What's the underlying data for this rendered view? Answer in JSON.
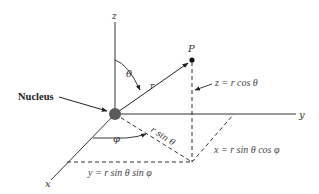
{
  "figure": {
    "labels": {
      "nucleus": "Nucleus",
      "point": "P",
      "axis_x": "x",
      "axis_y": "y",
      "axis_z": "z",
      "theta": "θ",
      "phi": "φ",
      "r": "r",
      "r_sin_theta": "r sin θ"
    },
    "equations": {
      "z": "z = r cos θ",
      "x": "x = r sin θ cos φ",
      "y": "y = r sin θ sin φ"
    },
    "colors": {
      "line": "#222222",
      "nucleus_fill": "#555555",
      "text": "#333333"
    }
  }
}
